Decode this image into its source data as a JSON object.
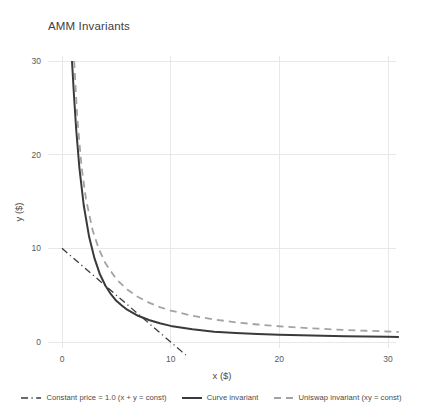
{
  "chart_data": {
    "type": "line",
    "title": "AMM Invariants",
    "xlabel": "x ($)",
    "ylabel": "y ($)",
    "xlim": [
      -1.2,
      31.5
    ],
    "ylim": [
      -1.5,
      30.8
    ],
    "xticks": [
      "0",
      "10",
      "20",
      "30"
    ],
    "xtick_values": [
      0,
      10,
      20,
      30
    ],
    "yticks": [
      "0",
      "10",
      "20",
      "30"
    ],
    "ytick_values": [
      0,
      10,
      20,
      30
    ],
    "grid": true,
    "legend_position": "below",
    "series": [
      {
        "name": "Constant price = 1.0 (x + y = const)",
        "style": "dashdot",
        "color": "#3a3a3a",
        "width": 1.3,
        "x": [
          0,
          1,
          2,
          3,
          4,
          5,
          6,
          7,
          8,
          9,
          10,
          11,
          11.4
        ],
        "values": [
          10,
          9,
          8,
          7,
          6,
          5,
          4,
          3,
          2,
          1,
          0,
          -1,
          -1.4
        ]
      },
      {
        "name": "Curve invariant",
        "style": "solid",
        "color": "#3a3a3a",
        "width": 2.0,
        "x": [
          0.92,
          1.1,
          1.3,
          1.6,
          2,
          2.5,
          3,
          3.5,
          4,
          4.5,
          5,
          5.5,
          6,
          7,
          8,
          9,
          10,
          12,
          14,
          16,
          18,
          20,
          22,
          24,
          26,
          28,
          30,
          31
        ],
        "values": [
          30,
          26.4,
          22.8,
          18.6,
          14.6,
          11.2,
          8.9,
          7.2,
          6.0,
          5.1,
          4.4,
          3.9,
          3.45,
          2.8,
          2.35,
          2.0,
          1.72,
          1.35,
          1.1,
          0.96,
          0.85,
          0.77,
          0.71,
          0.66,
          0.61,
          0.58,
          0.55,
          0.54
        ]
      },
      {
        "name": "Uniswap invariant (xy = const)",
        "style": "dashed",
        "color": "#a3a3a3",
        "width": 1.8,
        "x": [
          1.12,
          1.4,
          1.8,
          2.2,
          2.8,
          3.4,
          4,
          5,
          6,
          7,
          8,
          9,
          10,
          12,
          14,
          16,
          18,
          20,
          22,
          24,
          26,
          28,
          30,
          31
        ],
        "values": [
          30,
          24.0,
          18.7,
          15.3,
          12.0,
          9.9,
          8.4,
          6.7,
          5.6,
          4.8,
          4.2,
          3.73,
          3.36,
          2.8,
          2.4,
          2.1,
          1.87,
          1.68,
          1.53,
          1.4,
          1.29,
          1.2,
          1.12,
          1.08
        ]
      }
    ]
  },
  "legend": {
    "entries": [
      {
        "label": "Constant price = 1.0 (x + y = const)",
        "marker": "dashdot-line-swatch",
        "color": "#3a3a3a"
      },
      {
        "label": "Curve invariant",
        "marker": "solid-line-swatch",
        "color": "#3a3a3a"
      },
      {
        "label": "Uniswap invariant (xy = const)",
        "marker": "dashed-line-swatch",
        "color": "#a3a3a3"
      }
    ]
  },
  "axes": {
    "title": "AMM Invariants",
    "xlabel": "x ($)",
    "ylabel": "y ($)"
  },
  "colors": {
    "grid": "#e6e6e6",
    "text": "#4a4a4a",
    "dark_line": "#3a3a3a",
    "light_line": "#a3a3a3",
    "background": "#ffffff"
  }
}
